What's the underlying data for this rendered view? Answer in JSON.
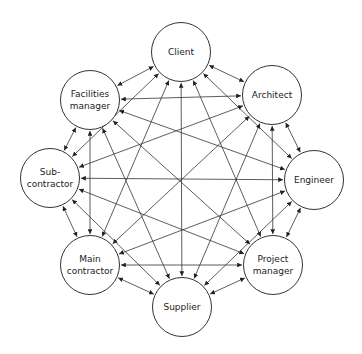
{
  "diagram": {
    "type": "fully-connected network",
    "nodes": [
      {
        "id": "client",
        "label": "Client",
        "x": 181,
        "y": 52
      },
      {
        "id": "architect",
        "label": "Architect",
        "x": 272,
        "y": 95
      },
      {
        "id": "engineer",
        "label": "Engineer",
        "x": 314,
        "y": 180
      },
      {
        "id": "project_manager",
        "label": "Project\nmanager",
        "x": 273,
        "y": 265
      },
      {
        "id": "supplier",
        "label": "Supplier",
        "x": 182,
        "y": 307
      },
      {
        "id": "main_contractor",
        "label": "Main\ncontractor",
        "x": 90,
        "y": 265
      },
      {
        "id": "sub_contractor",
        "label": "Sub-\ncontractor",
        "x": 50,
        "y": 178
      },
      {
        "id": "facilities_manager",
        "label": "Facilities\nmanager",
        "x": 90,
        "y": 100
      }
    ],
    "edges": "all pairs, bidirectional arrows",
    "line_color": "#333333"
  }
}
